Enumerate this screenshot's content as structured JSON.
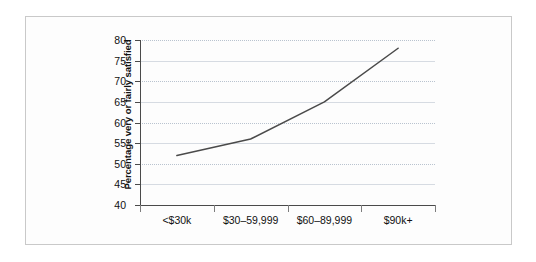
{
  "chart_data": {
    "type": "line",
    "title": "",
    "xlabel": "",
    "ylabel": "Percentage very or fairly satisfied",
    "categories": [
      "<$30k",
      "$30–59,999",
      "$60–89,999",
      "$90k+"
    ],
    "values": [
      52,
      56,
      65,
      78
    ],
    "series": [
      {
        "name": "Percentage very or fairly satisfied",
        "values": [
          52,
          56,
          65,
          78
        ]
      }
    ],
    "ylim": [
      40,
      80
    ],
    "ytick_step": 5,
    "ytick_labels": [
      "80",
      "75",
      "70",
      "65",
      "60",
      "55",
      "50",
      "45",
      "40"
    ],
    "ytick_values": [
      80,
      75,
      70,
      65,
      60,
      55,
      50,
      45,
      40
    ],
    "grid": true,
    "grid_axis": "y",
    "legend": false,
    "legend_position": "none",
    "line_color": "#4a4a4a",
    "grid_color": "#b9c3cf",
    "axis_color": "#4a4a4a",
    "background_color": "#ffffff",
    "frame_border_color": "#c9c9c9"
  }
}
